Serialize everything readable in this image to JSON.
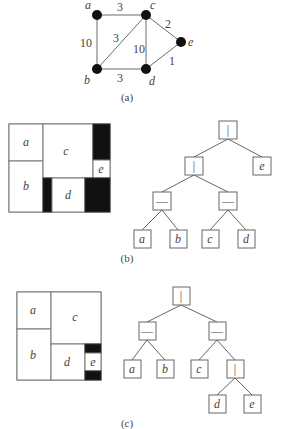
{
  "captions": {
    "a": "(a)",
    "b": "(b)",
    "c": "(c)"
  },
  "graph": {
    "nodes": [
      {
        "id": "a",
        "label": "a",
        "x": 97,
        "y": 15
      },
      {
        "id": "b",
        "label": "b",
        "x": 97,
        "y": 69
      },
      {
        "id": "c",
        "label": "c",
        "x": 146,
        "y": 15
      },
      {
        "id": "d",
        "label": "d",
        "x": 146,
        "y": 69
      },
      {
        "id": "e",
        "label": "e",
        "x": 181,
        "y": 42
      }
    ],
    "edges": [
      {
        "from": "a",
        "to": "c",
        "weight": "3"
      },
      {
        "from": "a",
        "to": "b",
        "weight": "10"
      },
      {
        "from": "b",
        "to": "c",
        "weight": "3"
      },
      {
        "from": "c",
        "to": "d",
        "weight": "10"
      },
      {
        "from": "c",
        "to": "e",
        "weight": "2"
      },
      {
        "from": "d",
        "to": "e",
        "weight": "1"
      },
      {
        "from": "b",
        "to": "d",
        "weight": "3"
      }
    ]
  },
  "floorplan_b": {
    "rooms": [
      "a",
      "b",
      "c",
      "d",
      "e"
    ]
  },
  "tree_b": {
    "ops": {
      "vertical": "|",
      "horizontal": "—"
    },
    "nodes": [
      {
        "id": "root",
        "label": "|"
      },
      {
        "id": "n1",
        "label": "|"
      },
      {
        "id": "e",
        "label": "e"
      },
      {
        "id": "n2",
        "label": "—"
      },
      {
        "id": "n3",
        "label": "—"
      },
      {
        "id": "a",
        "label": "a"
      },
      {
        "id": "b",
        "label": "b"
      },
      {
        "id": "c",
        "label": "c"
      },
      {
        "id": "d",
        "label": "d"
      }
    ]
  },
  "floorplan_c": {
    "rooms": [
      "a",
      "b",
      "c",
      "d",
      "e"
    ]
  },
  "tree_c": {
    "nodes": [
      {
        "id": "root",
        "label": "|"
      },
      {
        "id": "n1",
        "label": "—"
      },
      {
        "id": "n2",
        "label": "—"
      },
      {
        "id": "a",
        "label": "a"
      },
      {
        "id": "b",
        "label": "b"
      },
      {
        "id": "c",
        "label": "c"
      },
      {
        "id": "n3",
        "label": "|"
      },
      {
        "id": "d",
        "label": "d"
      },
      {
        "id": "e",
        "label": "e"
      }
    ]
  }
}
